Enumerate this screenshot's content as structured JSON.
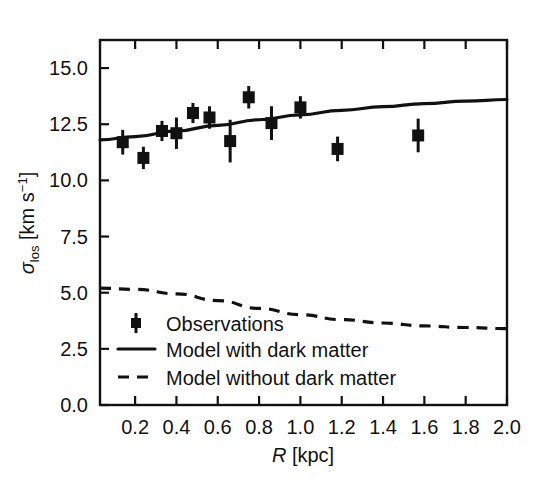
{
  "chart_data": {
    "type": "scatter",
    "title": "",
    "xlabel": "R [kpc]",
    "ylabel": "σlos [km s⁻¹]",
    "xlim": [
      0.03,
      2.0
    ],
    "ylim": [
      0.0,
      16.25
    ],
    "grid": false,
    "legend_position": "lower-left-inside",
    "x_ticks": [
      "0.2",
      "0.4",
      "0.6",
      "0.8",
      "1.0",
      "1.2",
      "1.4",
      "1.6",
      "1.8",
      "2.0"
    ],
    "x_tick_values": [
      0.2,
      0.4,
      0.6,
      0.8,
      1.0,
      1.2,
      1.4,
      1.6,
      1.8,
      2.0
    ],
    "y_ticks": [
      "0.0",
      "2.5",
      "5.0",
      "7.5",
      "10.0",
      "12.5",
      "15.0"
    ],
    "y_tick_values": [
      0.0,
      2.5,
      5.0,
      7.5,
      10.0,
      12.5,
      15.0
    ],
    "series": [
      {
        "name": "Observations",
        "type": "scatter-errorbar",
        "marker": "square",
        "color": "#111111",
        "points": [
          {
            "x": 0.14,
            "y": 11.7,
            "yerr": 0.55
          },
          {
            "x": 0.24,
            "y": 11.0,
            "yerr": 0.5
          },
          {
            "x": 0.33,
            "y": 12.2,
            "yerr": 0.45
          },
          {
            "x": 0.4,
            "y": 12.1,
            "yerr": 0.7
          },
          {
            "x": 0.48,
            "y": 13.0,
            "yerr": 0.45
          },
          {
            "x": 0.56,
            "y": 12.8,
            "yerr": 0.5
          },
          {
            "x": 0.66,
            "y": 11.75,
            "yerr": 0.95
          },
          {
            "x": 0.75,
            "y": 13.7,
            "yerr": 0.5
          },
          {
            "x": 0.86,
            "y": 12.55,
            "yerr": 0.75
          },
          {
            "x": 1.0,
            "y": 13.25,
            "yerr": 0.5
          },
          {
            "x": 1.18,
            "y": 11.4,
            "yerr": 0.55
          },
          {
            "x": 1.57,
            "y": 12.0,
            "yerr": 0.75
          }
        ]
      },
      {
        "name": "Model with dark matter",
        "type": "line",
        "style": "solid",
        "color": "#111111",
        "x": [
          0.03,
          0.2,
          0.4,
          0.6,
          0.8,
          1.0,
          1.2,
          1.4,
          1.6,
          1.8,
          2.0
        ],
        "y": [
          11.8,
          11.95,
          12.2,
          12.45,
          12.7,
          12.92,
          13.12,
          13.28,
          13.42,
          13.53,
          13.6
        ]
      },
      {
        "name": "Model without dark matter",
        "type": "line",
        "style": "dashed",
        "color": "#111111",
        "x": [
          0.03,
          0.2,
          0.4,
          0.6,
          0.8,
          1.0,
          1.2,
          1.4,
          1.6,
          1.8,
          2.0
        ],
        "y": [
          5.2,
          5.15,
          4.95,
          4.65,
          4.3,
          4.02,
          3.8,
          3.65,
          3.52,
          3.45,
          3.4
        ]
      }
    ]
  },
  "axes": {
    "xlabel_italic": "R",
    "xlabel_rest": " [kpc]",
    "ylabel_sigma": "σ",
    "ylabel_sub": "los",
    "ylabel_unit_open": " [km s",
    "ylabel_sup": "−1",
    "ylabel_close": "]"
  },
  "legend": {
    "items": [
      {
        "label": "Observations",
        "glyph": "errorbar-marker"
      },
      {
        "label": "Model with dark matter",
        "glyph": "solid-line"
      },
      {
        "label": "Model without dark matter",
        "glyph": "dashed-line"
      }
    ]
  }
}
